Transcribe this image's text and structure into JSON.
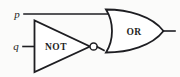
{
  "diagram": {
    "type": "logic-circuit",
    "title": "",
    "background_color": "#fbfbfa",
    "line_color": "#1e1e22",
    "inputs": [
      {
        "id": "p",
        "label": "p",
        "x": 17,
        "y": 18
      },
      {
        "id": "q",
        "label": "q",
        "x": 16,
        "y": 50
      }
    ],
    "gates": [
      {
        "id": "not-gate",
        "label": "NOT",
        "kind": "inverter",
        "label_x": 56,
        "label_y": 50,
        "has_bubble": true
      },
      {
        "id": "or-gate",
        "label": "OR",
        "kind": "or",
        "label_x": 134,
        "label_y": 35
      }
    ],
    "wires": [
      {
        "id": "p-input-wire",
        "from": "p",
        "to": "or-gate"
      },
      {
        "id": "q-input-wire",
        "from": "q",
        "to": "not-gate"
      },
      {
        "id": "not-to-or-wire",
        "from": "not-gate",
        "to": "or-gate"
      },
      {
        "id": "output-wire",
        "from": "or-gate",
        "to": "output"
      }
    ]
  }
}
